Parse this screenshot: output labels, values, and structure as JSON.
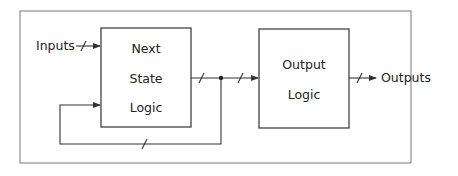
{
  "diagram": {
    "frame": {
      "x": 20,
      "y": 11,
      "w": 391,
      "h": 152
    },
    "blocks": [
      {
        "id": "next_state_logic",
        "lines": [
          "Next",
          "State",
          "Logic"
        ],
        "x": 101,
        "y": 28,
        "w": 90,
        "h": 99
      },
      {
        "id": "output_logic",
        "lines": [
          "Output",
          "Logic"
        ],
        "x": 259,
        "y": 29,
        "w": 90,
        "h": 99
      }
    ],
    "labels": {
      "inputs": "Inputs",
      "outputs": "Outputs"
    },
    "colors": {
      "stroke": "#333333",
      "frame": "#777777",
      "text": "#222222",
      "background": "#ffffff"
    }
  }
}
